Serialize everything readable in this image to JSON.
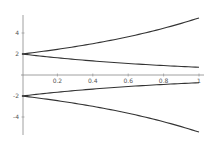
{
  "chart_data": {
    "type": "line",
    "title": "",
    "xlabel": "",
    "ylabel": "",
    "xlim": [
      0,
      1
    ],
    "ylim": [
      -6,
      6
    ],
    "grid": false,
    "legend": null,
    "x_ticks": [
      "0.2",
      "0.4",
      "0.6",
      "0.8",
      "1"
    ],
    "y_ticks": [
      "4",
      "2",
      "-2",
      "-4"
    ],
    "x": [
      0,
      0.1,
      0.2,
      0.3,
      0.4,
      0.5,
      0.6,
      0.7,
      0.8,
      0.9,
      1.0
    ],
    "series": [
      {
        "name": "2e^x",
        "values": [
          2.0,
          2.21,
          2.44,
          2.7,
          2.98,
          3.3,
          3.64,
          4.03,
          4.45,
          4.92,
          5.44
        ]
      },
      {
        "name": "2e^-x",
        "values": [
          2.0,
          1.81,
          1.64,
          1.48,
          1.34,
          1.21,
          1.1,
          0.99,
          0.9,
          0.81,
          0.74
        ]
      },
      {
        "name": "-2e^-x",
        "values": [
          -2.0,
          -1.81,
          -1.64,
          -1.48,
          -1.34,
          -1.21,
          -1.1,
          -0.99,
          -0.9,
          -0.81,
          -0.74
        ]
      },
      {
        "name": "-2e^x",
        "values": [
          -2.0,
          -2.21,
          -2.44,
          -2.7,
          -2.98,
          -3.3,
          -3.64,
          -4.03,
          -4.45,
          -4.92,
          -5.44
        ]
      }
    ],
    "line_color": "#333333"
  }
}
